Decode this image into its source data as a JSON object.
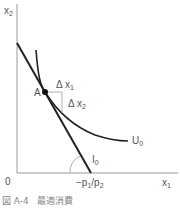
{
  "diagram": {
    "title": "最適消費",
    "caption_number": "図 A-4",
    "caption_text": "最適消費",
    "axes": {
      "y_label": "x",
      "y_label_sub": "2",
      "x_label": "x",
      "x_label_sub": "1",
      "origin_label": "0"
    },
    "point": {
      "label": "A"
    },
    "delta_x1": {
      "prefix": "Δ x",
      "sub": "1"
    },
    "delta_x2": {
      "prefix": "Δ x",
      "sub": "2"
    },
    "indifference_curve": {
      "label": "U",
      "sub": "0"
    },
    "budget_line": {
      "label": "I",
      "sub": "0"
    },
    "slope_label": {
      "text": "−p",
      "sub1": "1",
      "mid": "/p",
      "sub2": "2"
    },
    "colors": {
      "line": "#222222",
      "axis": "#999999",
      "text": "#555555"
    }
  }
}
